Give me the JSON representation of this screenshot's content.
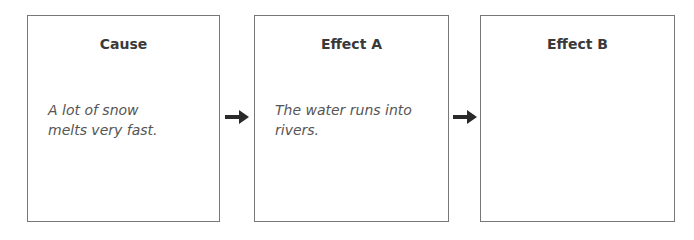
{
  "diagram": {
    "type": "cause-effect flow chart",
    "boxes": [
      {
        "title": "Cause",
        "text": "A lot of snow melts very fast."
      },
      {
        "title": "Effect A",
        "text": "The water runs into rivers."
      },
      {
        "title": "Effect B",
        "text": ""
      }
    ],
    "arrows": [
      {
        "from": "Cause",
        "to": "Effect A",
        "icon": "right-arrow-icon"
      },
      {
        "from": "Effect A",
        "to": "Effect B",
        "icon": "right-arrow-icon"
      }
    ],
    "colors": {
      "border": "#777777",
      "arrow": "#2a2a2a",
      "title": "#3a3a3a",
      "text": "#555555"
    }
  }
}
